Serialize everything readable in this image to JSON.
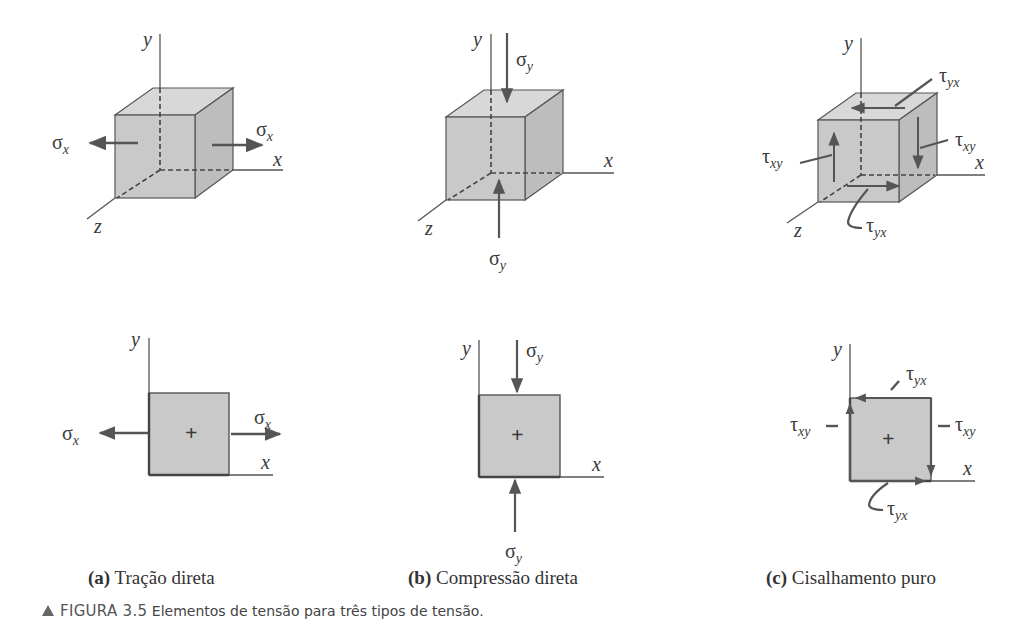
{
  "figure": {
    "number": "FIGURA 3.5",
    "caption": "Elementos de tensão para três tipos de tensão.",
    "marker_icon": "triangle-up-icon",
    "colors": {
      "fill": "#c9c9c9",
      "fill_top": "#d8d8d8",
      "fill_side": "#bdbdbd",
      "stroke": "#555555",
      "arrow": "#555555"
    }
  },
  "axes": {
    "x": "x",
    "y": "y",
    "z": "z"
  },
  "panels": [
    {
      "id": "a",
      "letter": "(a)",
      "title": "Tração direta",
      "cube_labels": {
        "left": "σ",
        "left_sub": "x",
        "right": "σ",
        "right_sub": "x"
      },
      "square_labels": {
        "left": "σ",
        "left_sub": "x",
        "right": "σ",
        "right_sub": "x",
        "center": "+"
      }
    },
    {
      "id": "b",
      "letter": "(b)",
      "title": "Compressão direta",
      "cube_labels": {
        "top": "σ",
        "top_sub": "y",
        "bottom": "σ",
        "bottom_sub": "y"
      },
      "square_labels": {
        "top": "σ",
        "top_sub": "y",
        "bottom": "σ",
        "bottom_sub": "y",
        "center": "+"
      }
    },
    {
      "id": "c",
      "letter": "(c)",
      "title": "Cisalhamento puro",
      "cube_labels": {
        "top": "τ",
        "top_sub": "yx",
        "right": "τ",
        "right_sub": "xy",
        "left": "τ",
        "left_sub": "xy",
        "bottom": "τ",
        "bottom_sub": "yx"
      },
      "square_labels": {
        "top": "τ",
        "top_sub": "yx",
        "right": "τ",
        "right_sub": "xy",
        "left": "τ",
        "left_sub": "xy",
        "bottom": "τ",
        "bottom_sub": "yx",
        "center": "+"
      }
    }
  ]
}
